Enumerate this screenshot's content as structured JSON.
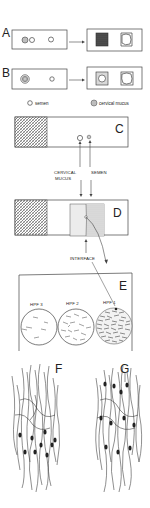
{
  "panels": {
    "A": {
      "label": "A"
    },
    "B": {
      "label": "B"
    },
    "C": {
      "label": "C"
    },
    "D": {
      "label": "D"
    },
    "E": {
      "label": "E"
    },
    "F": {
      "label": "F"
    },
    "G": {
      "label": "G"
    }
  },
  "legend": {
    "semen": "semen",
    "cervical_mucus": "cervical mucus"
  },
  "annotations": {
    "cervical_mucus_line1": "CERVICAL",
    "cervical_mucus_line2": "MUCUS",
    "semen": "SEMEN",
    "interface": "INTERFACE"
  },
  "fields": [
    {
      "label": "HPF 3",
      "density": "low"
    },
    {
      "label": "HPF 2",
      "density": "medium"
    },
    {
      "label": "HPF 1",
      "density": "high"
    }
  ],
  "colors": {
    "line": "#444444",
    "hatch": "#555555",
    "mucus_fill": "#bdbdbd",
    "dark_fill": "#3a3a3a"
  }
}
